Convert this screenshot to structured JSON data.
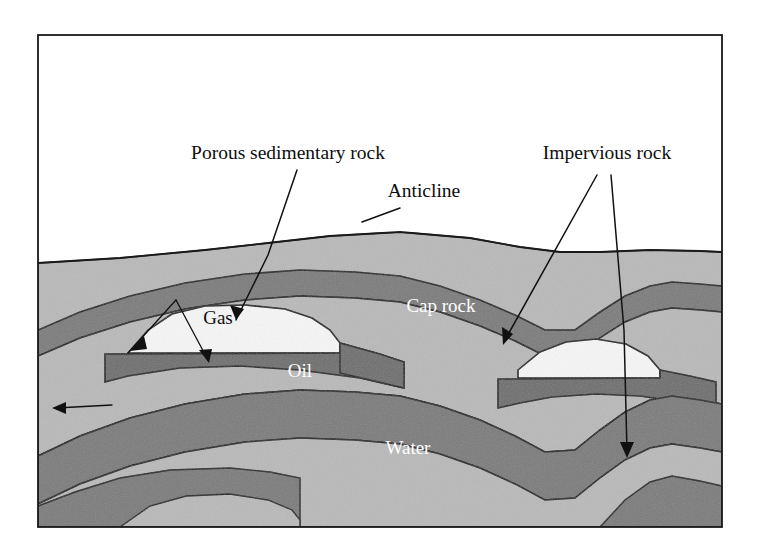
{
  "figure": {
    "type": "geological-cross-section",
    "frame": {
      "border_color": "#1a1a1a",
      "background": "#ffffff",
      "x": 38,
      "y": 35,
      "width": 684,
      "height": 492
    }
  },
  "palette": {
    "sky_white": "#ffffff",
    "porous_light_gray": "#b9b9b9",
    "impervious_dark_gray": "#7b7b7b",
    "gas_white": "#f4f4f4",
    "oil_dark": "#6e6e6e",
    "outline": "#1a1a1a",
    "label_dark": "#0d0d0d",
    "label_light": "#ffffff"
  },
  "callouts": [
    {
      "id": "porous-sedimentary-rock",
      "label": "Porous sedimentary rock",
      "x": 288,
      "y": 155,
      "leader_targets": 3
    },
    {
      "id": "anticline",
      "label": "Anticline",
      "x": 424,
      "y": 193,
      "leader_targets": 1
    },
    {
      "id": "impervious-rock",
      "label": "Impervious rock",
      "x": 607,
      "y": 155,
      "leader_targets": 2
    }
  ],
  "unit_labels": [
    {
      "id": "gas",
      "label": "Gas",
      "x": 218,
      "y": 320,
      "color": "dark"
    },
    {
      "id": "oil",
      "label": "Oil",
      "x": 300,
      "y": 373,
      "color": "light"
    },
    {
      "id": "cap-rock",
      "label": "Cap rock",
      "x": 441,
      "y": 308,
      "color": "light"
    },
    {
      "id": "water",
      "label": "Water",
      "x": 408,
      "y": 450,
      "color": "light"
    }
  ],
  "strata": [
    {
      "id": "surface-porous-layer",
      "material": "Porous sedimentary rock",
      "tone": "light"
    },
    {
      "id": "upper-impervious-layer",
      "material": "Impervious rock",
      "tone": "dark"
    },
    {
      "id": "reservoir-porous-layer",
      "material": "Porous sedimentary rock",
      "tone": "light"
    },
    {
      "id": "gas-cap",
      "material": "Gas",
      "tone": "white"
    },
    {
      "id": "oil-zone",
      "material": "Oil",
      "tone": "dark"
    },
    {
      "id": "water-zone",
      "material": "Water",
      "tone": "light"
    },
    {
      "id": "lower-impervious-layer",
      "material": "Impervious rock",
      "tone": "dark"
    },
    {
      "id": "basal-porous-layer",
      "material": "Porous sedimentary rock",
      "tone": "light"
    }
  ]
}
